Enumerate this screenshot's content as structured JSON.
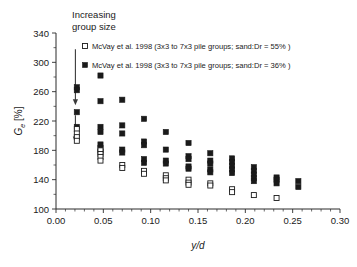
{
  "chart_data": {
    "type": "scatter",
    "title": "",
    "xlabel": "y/d",
    "ylabel": "G_e [%]",
    "ylabel_parts": {
      "main": "G",
      "sub": "e",
      "unit": "[%]"
    },
    "xlim": [
      0.0,
      0.3
    ],
    "ylim": [
      100,
      340
    ],
    "xticks": [
      "0.00",
      "0.05",
      "0.10",
      "0.15",
      "0.20",
      "0.25",
      "0.30"
    ],
    "xtick_values": [
      0.0,
      0.05,
      0.1,
      0.15,
      0.2,
      0.25,
      0.3
    ],
    "yticks": [
      "100",
      "140",
      "180",
      "220",
      "260",
      "300",
      "340"
    ],
    "ytick_values": [
      100,
      140,
      180,
      220,
      260,
      300,
      340
    ],
    "grid": false,
    "legend_position": "top-left-inside",
    "series": [
      {
        "name": "McVay et al. 1998 (3x3 to 7x3 pile groups; sand:Dr = 55% )",
        "marker": "open-square",
        "color": "#ffffff",
        "edge_color": "#1a1a1a",
        "points": [
          [
            0.022,
            209
          ],
          [
            0.022,
            203
          ],
          [
            0.022,
            198
          ],
          [
            0.022,
            193
          ],
          [
            0.047,
            180
          ],
          [
            0.047,
            175
          ],
          [
            0.047,
            171
          ],
          [
            0.047,
            166
          ],
          [
            0.07,
            160
          ],
          [
            0.07,
            156
          ],
          [
            0.093,
            152
          ],
          [
            0.093,
            148
          ],
          [
            0.116,
            146
          ],
          [
            0.116,
            142
          ],
          [
            0.116,
            139
          ],
          [
            0.14,
            140
          ],
          [
            0.14,
            136
          ],
          [
            0.14,
            133
          ],
          [
            0.163,
            135
          ],
          [
            0.163,
            132
          ],
          [
            0.186,
            127
          ],
          [
            0.186,
            123
          ],
          [
            0.209,
            119
          ],
          [
            0.233,
            115
          ]
        ]
      },
      {
        "name": "McVay et al. 1998 (3x3 to 7x3 pile groups; sand:Dr = 36% )",
        "marker": "filled-square",
        "color": "#1a1a1a",
        "edge_color": "#1a1a1a",
        "points": [
          [
            0.022,
            266
          ],
          [
            0.022,
            262
          ],
          [
            0.022,
            232
          ],
          [
            0.022,
            212
          ],
          [
            0.047,
            282
          ],
          [
            0.047,
            247
          ],
          [
            0.047,
            212
          ],
          [
            0.047,
            205
          ],
          [
            0.047,
            188
          ],
          [
            0.047,
            183
          ],
          [
            0.047,
            178
          ],
          [
            0.07,
            249
          ],
          [
            0.07,
            214
          ],
          [
            0.07,
            203
          ],
          [
            0.07,
            181
          ],
          [
            0.07,
            177
          ],
          [
            0.093,
            223
          ],
          [
            0.093,
            192
          ],
          [
            0.093,
            187
          ],
          [
            0.093,
            168
          ],
          [
            0.093,
            163
          ],
          [
            0.116,
            205
          ],
          [
            0.116,
            181
          ],
          [
            0.116,
            166
          ],
          [
            0.116,
            162
          ],
          [
            0.14,
            190
          ],
          [
            0.14,
            172
          ],
          [
            0.14,
            168
          ],
          [
            0.14,
            158
          ],
          [
            0.14,
            155
          ],
          [
            0.163,
            176
          ],
          [
            0.163,
            166
          ],
          [
            0.163,
            162
          ],
          [
            0.163,
            154
          ],
          [
            0.163,
            150
          ],
          [
            0.186,
            169
          ],
          [
            0.186,
            164
          ],
          [
            0.186,
            159
          ],
          [
            0.186,
            154
          ],
          [
            0.186,
            149
          ],
          [
            0.209,
            157
          ],
          [
            0.209,
            152
          ],
          [
            0.209,
            147
          ],
          [
            0.209,
            142
          ],
          [
            0.209,
            138
          ],
          [
            0.233,
            143
          ],
          [
            0.233,
            140
          ],
          [
            0.233,
            135
          ],
          [
            0.256,
            138
          ],
          [
            0.256,
            130
          ]
        ]
      }
    ],
    "annotations": [
      {
        "name": "increasing-group-size",
        "text_line1": "Increasing",
        "text_line2": "group size",
        "arrows": [
          {
            "x": 0.0205,
            "y_start": 318,
            "y_end": 243
          },
          {
            "x": 0.0205,
            "y_start": 228,
            "y_end": 192
          }
        ]
      }
    ]
  }
}
